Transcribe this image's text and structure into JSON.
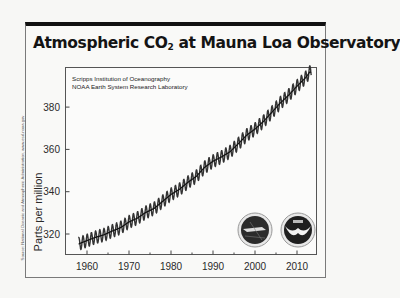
{
  "title": {
    "prefix": "Atmospheric CO",
    "subscript": "2",
    "suffix": " at Mauna Loa Observatory"
  },
  "source_note": "Source: National Oceanic and Atmospheric Administration, www.esrl.noaa.gov",
  "credits": [
    "Scripps Institution of Oceanography",
    "NOAA Earth System Research Laboratory"
  ],
  "logos": [
    {
      "name": "scripps-logo",
      "fill": "#2b2b2b"
    },
    {
      "name": "noaa-logo",
      "fill": "#1f1f1f"
    }
  ],
  "chart_data": {
    "type": "line",
    "title": "Atmospheric CO2 at Mauna Loa Observatory",
    "xlabel": "",
    "ylabel": "Parts per million",
    "xlim": [
      1955.5,
      2014.5
    ],
    "ylim": [
      306,
      400
    ],
    "xticks": [
      1960,
      1970,
      1980,
      1990,
      2000,
      2010
    ],
    "yticks": [
      320,
      340,
      360,
      380
    ],
    "grid": false,
    "legend": null,
    "annotations": [
      "Scripps Institution of Oceanography",
      "NOAA Earth System Research Laboratory"
    ],
    "series": [
      {
        "name": "Annual mean CO2 (ppm)",
        "x": [
          1958,
          1960,
          1962,
          1964,
          1966,
          1968,
          1970,
          1972,
          1974,
          1976,
          1978,
          1980,
          1982,
          1984,
          1986,
          1988,
          1990,
          1992,
          1994,
          1996,
          1998,
          2000,
          2002,
          2004,
          2006,
          2008,
          2010,
          2012,
          2013
        ],
        "values": [
          315.3,
          316.9,
          318.4,
          319.6,
          321.4,
          323.0,
          325.7,
          327.5,
          330.2,
          332.1,
          335.4,
          338.7,
          341.1,
          344.4,
          347.2,
          351.5,
          354.4,
          356.4,
          358.8,
          362.6,
          366.7,
          369.6,
          373.2,
          377.5,
          381.9,
          385.6,
          389.9,
          393.8,
          396.5
        ]
      }
    ],
    "seasonal_amplitude_ppm": 6
  }
}
